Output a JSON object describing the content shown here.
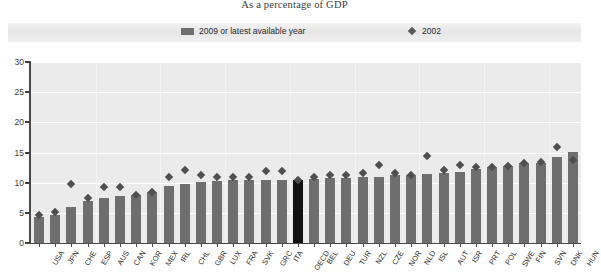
{
  "subtitle": "As a percentage of GDP",
  "legend": {
    "items": [
      {
        "label": "2009 or latest available year",
        "kind": "bar",
        "color": "#6e6e6e"
      },
      {
        "label": "2002",
        "kind": "diamond",
        "color": "#5a5a5a"
      }
    ]
  },
  "colors": {
    "bar": "#6e6e6e",
    "bar_highlight": "#111111",
    "marker": "#4f4f4f",
    "plot_background": "#ebebeb",
    "gridline": "#ffffff",
    "axis": "#4a4a4a"
  },
  "chart_data": {
    "type": "bar",
    "title": "As a percentage of GDP",
    "xlabel": "",
    "ylabel": "",
    "ylim": [
      0,
      30
    ],
    "yticks": [
      0,
      5,
      10,
      15,
      20,
      25,
      30
    ],
    "grid": true,
    "legend_position": "top",
    "categories": [
      "USA",
      "JPN",
      "CHE",
      "ESP",
      "AUS",
      "CAN",
      "KOR",
      "MEX",
      "IRL",
      "CHL",
      "GBR",
      "LUX",
      "FRA",
      "SVK",
      "GRC",
      "ITA",
      "OECD",
      "BEL",
      "DEU",
      "TUR",
      "NZL",
      "CZE",
      "NOR",
      "NLD",
      "ISL",
      "AUT",
      "ISR",
      "PRT",
      "POL",
      "SWE",
      "FIN",
      "SVN",
      "DNK",
      "HUN"
    ],
    "series": [
      {
        "name": "2009 or latest available year",
        "type": "bar",
        "values": [
          4.3,
          4.6,
          6.0,
          6.9,
          7.5,
          7.8,
          8.0,
          8.5,
          9.5,
          9.8,
          10.1,
          10.2,
          10.4,
          10.4,
          10.5,
          10.5,
          10.5,
          10.6,
          10.7,
          10.8,
          10.9,
          11.0,
          11.2,
          11.3,
          11.4,
          11.6,
          11.8,
          12.3,
          12.6,
          12.7,
          13.2,
          13.3,
          14.2,
          15.1
        ],
        "color": "#6e6e6e",
        "highlight_index": 16,
        "highlight_color": "#111111"
      },
      {
        "name": "2002",
        "type": "scatter",
        "marker": "diamond",
        "values": [
          4.6,
          5.2,
          9.8,
          7.5,
          9.3,
          9.2,
          8.0,
          8.4,
          11.0,
          12.1,
          11.2,
          11.0,
          10.9,
          11.0,
          12.0,
          11.9,
          10.5,
          11.0,
          11.3,
          11.3,
          11.6,
          12.9,
          11.6,
          11.2,
          14.5,
          12.1,
          12.9,
          12.6,
          12.6,
          12.7,
          13.3,
          13.4,
          15.9,
          13.8
        ],
        "color": "#4f4f4f"
      }
    ]
  }
}
